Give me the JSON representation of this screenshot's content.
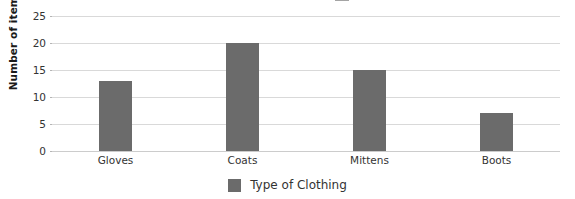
{
  "chart_data": {
    "type": "bar",
    "title": "",
    "title_cropped": true,
    "categories": [
      "Gloves",
      "Coats",
      "Mittens",
      "Boots"
    ],
    "values": [
      13,
      20,
      15,
      7
    ],
    "series": [
      {
        "name": "Type of Clothing",
        "values": [
          13,
          20,
          15,
          7
        ]
      }
    ],
    "xlabel": "",
    "ylabel": "Number of items",
    "ylim": [
      0,
      25
    ],
    "ytick_labels": [
      "0",
      "5",
      "10",
      "15",
      "20",
      "25"
    ],
    "ytick_values": [
      0,
      5,
      10,
      15,
      20,
      25
    ],
    "grid": "horizontal",
    "legend_position": "bottom",
    "bar_color": "#6b6b6b",
    "gridline_color": "#d9d9d9",
    "background_color": "#ffffff",
    "text_color": "#333333"
  },
  "axes": {
    "y_title": "Number of items"
  },
  "legend": {
    "entries": [
      {
        "label": "Type of Clothing",
        "color": "#6b6b6b"
      }
    ]
  }
}
